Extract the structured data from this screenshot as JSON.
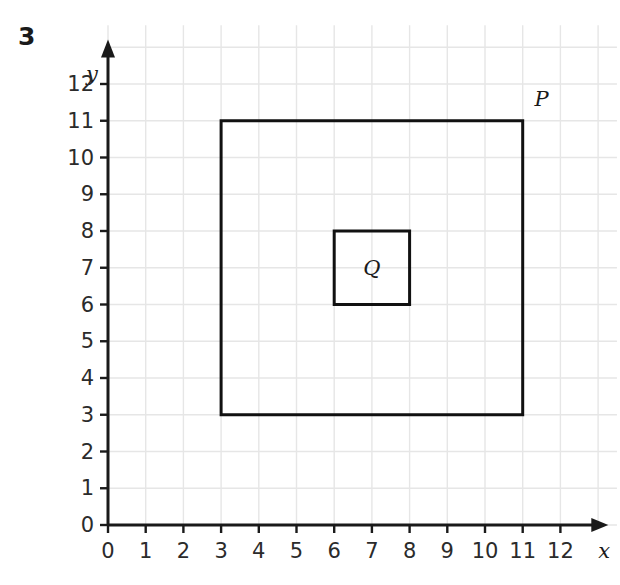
{
  "figure": {
    "question_number": "3",
    "x_axis": {
      "name": "x",
      "ticks": [
        "0",
        "1",
        "2",
        "3",
        "4",
        "5",
        "6",
        "7",
        "8",
        "9",
        "10",
        "11",
        "12"
      ],
      "min": 0,
      "max": 12
    },
    "y_axis": {
      "name": "y",
      "ticks": [
        "0",
        "1",
        "2",
        "3",
        "4",
        "5",
        "6",
        "7",
        "8",
        "9",
        "10",
        "11",
        "12"
      ],
      "min": 0,
      "max": 12
    },
    "grid": {
      "enabled": true,
      "color": "#e6e6e6",
      "spacing": 1
    },
    "axis_color": "#1a1a1a",
    "shape_color": "#111111"
  },
  "chart_data": {
    "type": "scatter",
    "title": "",
    "xlabel": "x",
    "ylabel": "y",
    "xlim": [
      0,
      12
    ],
    "ylim": [
      0,
      12
    ],
    "grid": true,
    "legend": "none",
    "x_ticks": [
      0,
      1,
      2,
      3,
      4,
      5,
      6,
      7,
      8,
      9,
      10,
      11,
      12
    ],
    "y_ticks": [
      0,
      1,
      2,
      3,
      4,
      5,
      6,
      7,
      8,
      9,
      10,
      11,
      12
    ],
    "shapes": [
      {
        "name": "P",
        "type": "square",
        "label": "P",
        "label_position": [
          11.5,
          11.6
        ],
        "vertices": [
          [
            3,
            3
          ],
          [
            3,
            11
          ],
          [
            11,
            11
          ],
          [
            11,
            3
          ]
        ],
        "side_length": 8,
        "x_range": [
          3,
          11
        ],
        "y_range": [
          3,
          11
        ],
        "stroke": "#111111",
        "stroke_width": 3,
        "fill": "none"
      },
      {
        "name": "Q",
        "type": "square",
        "label": "Q",
        "label_position": [
          7,
          7
        ],
        "vertices": [
          [
            6,
            6
          ],
          [
            6,
            8
          ],
          [
            8,
            8
          ],
          [
            8,
            6
          ]
        ],
        "side_length": 2,
        "x_range": [
          6,
          8
        ],
        "y_range": [
          6,
          8
        ],
        "stroke": "#111111",
        "stroke_width": 3,
        "fill": "none"
      }
    ]
  },
  "labels": {
    "p": "P",
    "q": "Q"
  }
}
